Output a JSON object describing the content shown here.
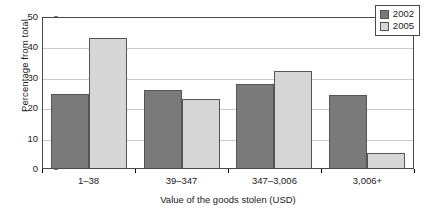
{
  "chart_data": {
    "type": "bar",
    "title": "",
    "subtitle": "",
    "xlabel": "Value of the goods stolen (USD)",
    "ylabel": "Percentage from total",
    "categories": [
      "1–38",
      "39–347",
      "347–3,006",
      "3,006+"
    ],
    "series": [
      {
        "name": "2002",
        "color": "#7a7a7a",
        "values": [
          24.5,
          25.5,
          27.5,
          24.1
        ]
      },
      {
        "name": "2005",
        "color": "#d6d6d6",
        "values": [
          42.8,
          22.6,
          32.0,
          5.1
        ]
      }
    ],
    "ylim": [
      0,
      50
    ],
    "ytick_values": [
      0,
      10,
      20,
      30,
      40,
      50
    ],
    "ytick_labels": [
      "0",
      "10",
      "20",
      "30",
      "40",
      "50"
    ],
    "gridlines": {
      "horizontal": true,
      "vertical": false,
      "at": [
        10,
        20,
        30,
        40
      ]
    },
    "legend": {
      "position": "top-right-inside",
      "entries": [
        "2002",
        "2005"
      ]
    },
    "axis_frame": true,
    "colors": {
      "series_2002": "#7a7a7a",
      "series_2005": "#d6d6d6",
      "gridline": "#c8c8c8",
      "frame": "#4a4a4a",
      "background": "#ffffff",
      "text": "#1a1a1a"
    }
  }
}
